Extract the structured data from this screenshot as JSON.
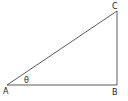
{
  "diagram": {
    "type": "right-triangle",
    "vertices": [
      {
        "label": "A",
        "x": 7,
        "y": 85
      },
      {
        "label": "B",
        "x": 117,
        "y": 85
      },
      {
        "label": "C",
        "x": 117,
        "y": 11
      }
    ],
    "angle_label": "θ",
    "right_angle_at": "B",
    "stroke_color": "#333333",
    "background": "#ffffff"
  }
}
